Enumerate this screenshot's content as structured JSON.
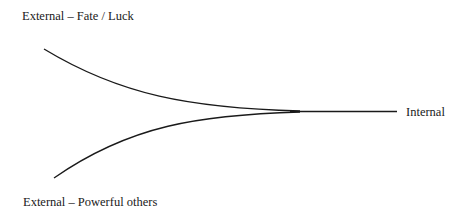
{
  "diagram": {
    "title": "",
    "labels": {
      "top_left": "External – Fate / Luck",
      "bottom_left": "External – Powerful others",
      "right": "Internal"
    },
    "curves": [
      {
        "name": "fate-luck-curve",
        "from": "External – Fate / Luck",
        "to": "Internal"
      },
      {
        "name": "powerful-others-curve",
        "from": "External – Powerful others",
        "to": "Internal"
      }
    ],
    "line_color": "#1a1a1a"
  }
}
